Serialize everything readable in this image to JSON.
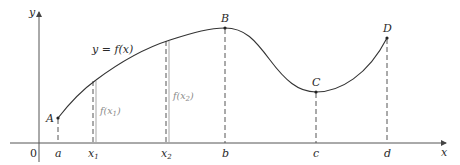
{
  "diagram": {
    "function_label": "y = f(x)",
    "axes": {
      "x_label": "x",
      "y_label": "y",
      "origin_label": "0"
    },
    "points": [
      {
        "name": "A",
        "x_label": "a"
      },
      {
        "name": "B",
        "x_label": "b"
      },
      {
        "name": "C",
        "x_label": "c"
      },
      {
        "name": "D",
        "x_label": "d"
      }
    ],
    "x_ticks": [
      "a",
      "x1",
      "x2",
      "b",
      "c",
      "d"
    ],
    "height_markers": [
      {
        "label": "f(x1)",
        "at": "x1"
      },
      {
        "label": "f(x2)",
        "at": "x2"
      }
    ],
    "colors": {
      "curve": "#333333",
      "axes": "#555555",
      "dashed": "#555555",
      "height_bar": "#a0a0a0"
    }
  }
}
